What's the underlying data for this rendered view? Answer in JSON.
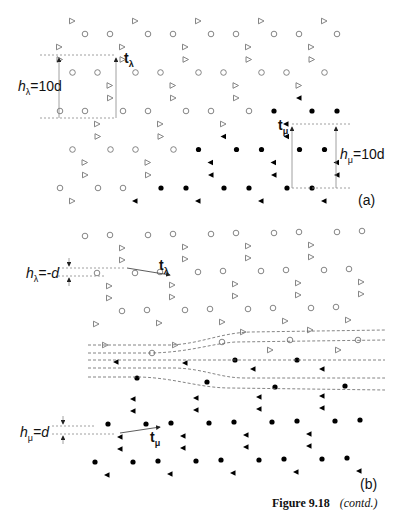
{
  "figure": {
    "caption_number": "Figure 9.18",
    "caption_note": "(contd.)",
    "colors": {
      "open": "#777777",
      "filled": "#000000",
      "guide": "#888888",
      "arrow": "#333333"
    }
  },
  "panel_a": {
    "tag": "(a)",
    "lattice": {
      "origin": [
        110,
        34
      ],
      "a": [
        63,
        0
      ],
      "b": [
        -12.5,
        38.5
      ],
      "basis_open": [
        [
          0,
          0,
          "circle"
        ],
        [
          -13,
          13,
          "tri"
        ]
      ],
      "extra_sites": [
        [
          25,
          -13,
          "tri"
        ]
      ],
      "x_range": [
        55,
        345
      ],
      "y_range": [
        20,
        210
      ],
      "interface": {
        "point": [
          350,
          68
        ],
        "slope": 0.53
      }
    },
    "h_lambda": {
      "var": "h",
      "sub": "λ",
      "value": "=10d"
    },
    "t_lambda": {
      "vec": "t",
      "sub": "λ"
    },
    "h_mu": {
      "var": "h",
      "sub": "μ",
      "value": "=10d"
    },
    "t_mu": {
      "vec": "t",
      "sub": "μ"
    }
  },
  "panel_b": {
    "tag": "(b)",
    "h_lambda": {
      "var": "h",
      "sub": "λ",
      "value": "=-d"
    },
    "t_lambda": {
      "vec": "t",
      "sub": "λ"
    },
    "h_mu": {
      "var": "h",
      "sub": "μ",
      "value": "=d"
    },
    "t_mu": {
      "vec": "t",
      "sub": "μ"
    },
    "interface_y": [
      330,
      390
    ]
  }
}
